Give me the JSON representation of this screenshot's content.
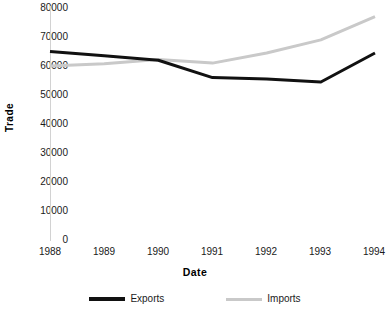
{
  "chart_data": {
    "type": "line",
    "title": "",
    "xlabel": "Date",
    "ylabel": "Trade",
    "x": [
      "1988",
      "1989",
      "1990",
      "1991",
      "1992",
      "1993",
      "1994"
    ],
    "categories": [
      "1988",
      "1989",
      "1990",
      "1991",
      "1992",
      "1993",
      "1994"
    ],
    "series": [
      {
        "name": "Exports",
        "color": "#111111",
        "values": [
          65000,
          63500,
          62000,
          56000,
          55500,
          54500,
          64500
        ]
      },
      {
        "name": "Imports",
        "color": "#c9c9c9",
        "values": [
          60000,
          60800,
          62200,
          61000,
          64500,
          69000,
          77000
        ]
      }
    ],
    "ylim": [
      0,
      80000
    ],
    "ytick_labels": [
      "80000",
      "70000",
      "60000",
      "50000",
      "40000",
      "30000",
      "20000",
      "10000",
      "0"
    ],
    "ytick_values": [
      80000,
      70000,
      60000,
      50000,
      40000,
      30000,
      20000,
      10000,
      0
    ],
    "xtick_labels": [
      "1988",
      "1989",
      "1990",
      "1991",
      "1992",
      "1993",
      "1994"
    ],
    "grid": false,
    "legend_position": "bottom"
  },
  "axis": {
    "y_title": "Trade",
    "x_title": "Date"
  },
  "legend": {
    "entries": [
      {
        "label": "Exports",
        "color": "#111111"
      },
      {
        "label": "Imports",
        "color": "#c9c9c9"
      }
    ]
  }
}
